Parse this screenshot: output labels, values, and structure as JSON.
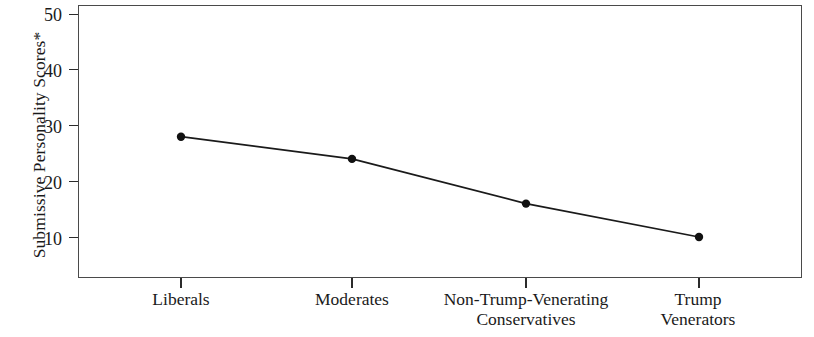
{
  "chart_data": {
    "type": "line",
    "title": "",
    "xlabel": "",
    "ylabel": "Submissive Personality Scores*",
    "categories": [
      "Liberals",
      "Moderates",
      "Non-Trump-Venerating\nConservatives",
      "Trump\nVenerators"
    ],
    "values": [
      28,
      24,
      16,
      10
    ],
    "ylim": [
      0,
      53
    ],
    "yticks": [
      10,
      20,
      30,
      40,
      50
    ],
    "ytick_labels": [
      "10",
      "20",
      "30",
      "40",
      "50"
    ],
    "grid": false,
    "legend": false,
    "marker": "filled-circle",
    "line_color": "#1a1a1a",
    "marker_color": "#111111",
    "frame_color": "#4a4a4a",
    "background": "#ffffff"
  },
  "axes": {
    "y_title": "Submissive Personality Scores*",
    "y_tick_0": "10",
    "y_tick_1": "20",
    "y_tick_2": "30",
    "y_tick_3": "40",
    "y_tick_4": "50",
    "x_tick_0": "Liberals",
    "x_tick_1": "Moderates",
    "x_tick_2": "Non-Trump-Venerating\nConservatives",
    "x_tick_3": "Trump\nVenerators"
  }
}
